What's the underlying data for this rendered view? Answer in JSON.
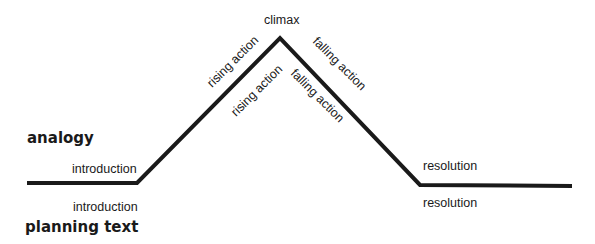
{
  "diagram": {
    "title_labels": {
      "top": "analogy",
      "bottom": "planning text"
    },
    "stages": [
      {
        "key": "introduction",
        "top_label": "introduction",
        "bottom_label": "introduction"
      },
      {
        "key": "rising",
        "top_label": "rising action",
        "bottom_label": "rising action"
      },
      {
        "key": "climax",
        "top_label": "climax"
      },
      {
        "key": "falling",
        "top_label": "falling action",
        "bottom_label": "falling action"
      },
      {
        "key": "resolution",
        "top_label": "resolution",
        "bottom_label": "resolution"
      }
    ],
    "line_color": "#1a1a1a"
  }
}
